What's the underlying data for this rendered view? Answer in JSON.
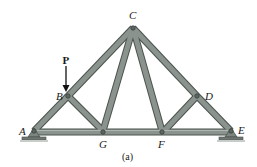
{
  "diagram": {
    "type": "truss",
    "caption": "(a)",
    "load": {
      "label": "P",
      "at_node": "B",
      "direction": "down"
    },
    "nodes": {
      "A": {
        "label": "A"
      },
      "B": {
        "label": "B"
      },
      "C": {
        "label": "C"
      },
      "D": {
        "label": "D"
      },
      "E": {
        "label": "E"
      },
      "F": {
        "label": "F"
      },
      "G": {
        "label": "G"
      }
    },
    "members": [
      "AB",
      "BC",
      "CD",
      "DE",
      "AG",
      "GF",
      "FE",
      "BG",
      "CG",
      "CF",
      "DF"
    ],
    "supports": [
      {
        "node": "A",
        "type": "pin"
      },
      {
        "node": "E",
        "type": "roller"
      }
    ],
    "colors": {
      "member_fill": "#8a938d",
      "member_edge": "#4a524d",
      "support": "#7d8580"
    }
  }
}
